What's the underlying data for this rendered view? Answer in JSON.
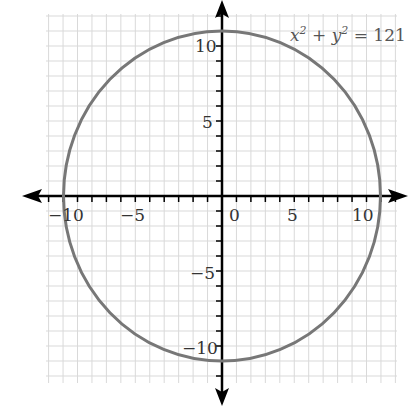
{
  "chart_data": {
    "type": "line",
    "title": "",
    "annotation": "x² + y² = 121",
    "annotation_parts": {
      "x": "x",
      "x_exp": "2",
      "plus": " + ",
      "y": "y",
      "y_exp": "2",
      "rhs": " = 121"
    },
    "xlabel": "x",
    "ylabel": "y",
    "xlim": [
      -12,
      12
    ],
    "ylim": [
      -12,
      12
    ],
    "grid": true,
    "x_tick_labels": [
      "-10",
      "-5",
      "0",
      "5",
      "10"
    ],
    "y_tick_labels": [
      "10",
      "5",
      "-5",
      "-10"
    ],
    "series": [
      {
        "name": "circle",
        "equation": "x^2 + y^2 = 121",
        "center": [
          0,
          0
        ],
        "radius": 11,
        "color": "#777777"
      }
    ]
  },
  "labels": {
    "x_ticks": [
      "−10",
      "−5",
      "0",
      "5",
      "10"
    ],
    "y_ticks": [
      "10",
      "5",
      "−5",
      "−10"
    ],
    "y_axis": "y"
  },
  "colors": {
    "grid": "#d9d9d9",
    "axis": "#000000",
    "curve": "#777777"
  }
}
